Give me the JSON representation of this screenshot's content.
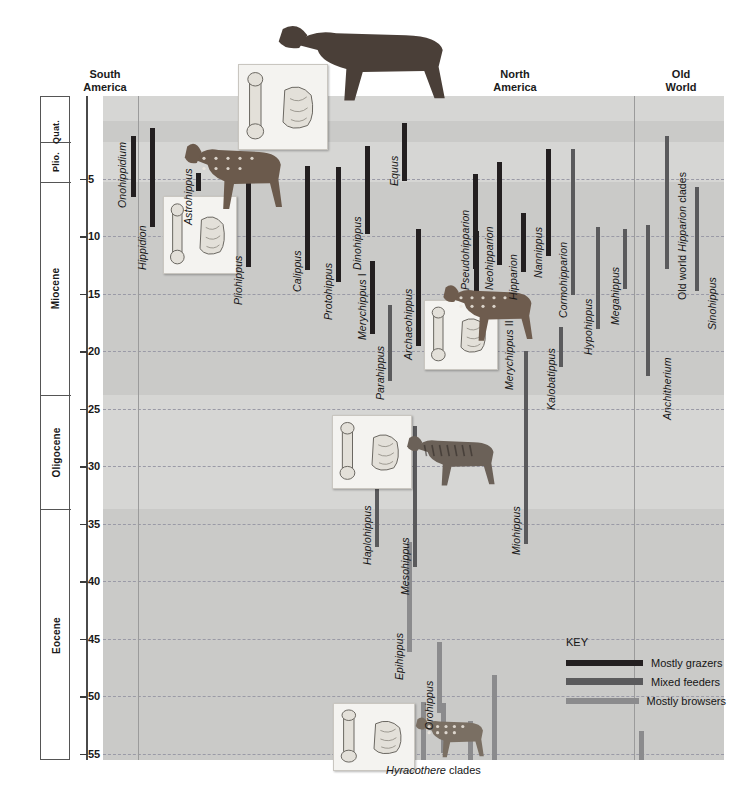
{
  "axis": {
    "title": "Million years ago",
    "ticks": [
      5,
      10,
      15,
      20,
      25,
      30,
      35,
      40,
      45,
      50,
      55
    ],
    "range_ma": [
      0,
      58
    ],
    "epochs": [
      {
        "name": "Quat.",
        "start_ma": 0,
        "end_ma": 1.8
      },
      {
        "name": "Plio.",
        "start_ma": 1.8,
        "end_ma": 5.3
      },
      {
        "name": "Miocene",
        "start_ma": 5.3,
        "end_ma": 23.8
      },
      {
        "name": "Oligocene",
        "start_ma": 23.8,
        "end_ma": 33.7
      },
      {
        "name": "Eocene",
        "start_ma": 33.7,
        "end_ma": 58
      }
    ]
  },
  "regions": [
    {
      "name": "South\nAmerica",
      "x_center": 105
    },
    {
      "name": "North\nAmerica",
      "x_center": 515
    },
    {
      "name": "Old\nWorld",
      "x_center": 681
    }
  ],
  "key": {
    "title": "KEY",
    "entries": [
      {
        "label": "Mostly grazers",
        "color": "#231f20"
      },
      {
        "label": "Mixed feeders",
        "color": "#5a5a5c"
      },
      {
        "label": "Mostly browsers",
        "color": "#8b8b8d"
      }
    ]
  },
  "footer_label": {
    "italic": "Hyracothere",
    "roman": " clades"
  },
  "chart_data": {
    "type": "bar",
    "ylabel": "Million years ago",
    "ylim": [
      0,
      58
    ],
    "grid": true,
    "legend": [
      "Mostly grazers",
      "Mixed feeders",
      "Mostly browsers"
    ],
    "categories": [
      "Onohippidium",
      "Hippidion",
      "Astrohippus",
      "Pliohippus",
      "Calippus",
      "Protohippus",
      "Dinohippus",
      "Equus",
      "Merychippus I",
      "Parahippus",
      "Archaeohippus",
      "Merychippus II",
      "Pseudohipparion",
      "Neohipparion",
      "Hipparion",
      "Nannippus",
      "Cormohipparion",
      "Kalobatippus",
      "Hypohippus",
      "Megahippus",
      "Old world Hipparion clades",
      "Sinohippus",
      "Anchitherium",
      "Haplohippus",
      "Mesohippus",
      "Miohippus",
      "Epihippus",
      "Orohippus",
      "Hyracothere clade A",
      "Hyracothere clade B",
      "Hyracothere clade C",
      "Hyracothere clade D",
      "Old World hyracothere"
    ],
    "series": [
      {
        "name": "stratigraphic ranges (Ma)",
        "bars": [
          {
            "taxon": "Onohippidium",
            "x": 131,
            "top_ma": 1.3,
            "bottom_ma": 6.6,
            "feeding": "Mostly grazers",
            "region": "South America"
          },
          {
            "taxon": "Hippidion",
            "x": 150,
            "top_ma": 0.6,
            "bottom_ma": 9.2,
            "feeding": "Mostly grazers",
            "region": "South America"
          },
          {
            "taxon": "Astrohippus",
            "x": 196,
            "top_ma": 4.5,
            "bottom_ma": 6.1,
            "feeding": "Mostly grazers",
            "region": "North America"
          },
          {
            "taxon": "Pliohippus",
            "x": 246,
            "top_ma": 4.0,
            "bottom_ma": 12.7,
            "feeding": "Mostly grazers",
            "region": "North America"
          },
          {
            "taxon": "Calippus",
            "x": 305,
            "top_ma": 3.9,
            "bottom_ma": 13.0,
            "feeding": "Mostly grazers",
            "region": "North America"
          },
          {
            "taxon": "Protohippus",
            "x": 336,
            "top_ma": 4.0,
            "bottom_ma": 14.0,
            "feeding": "Mostly grazers",
            "region": "North America"
          },
          {
            "taxon": "Dinohippus",
            "x": 365,
            "top_ma": 2.2,
            "bottom_ma": 9.8,
            "feeding": "Mostly grazers",
            "region": "North America"
          },
          {
            "taxon": "Equus",
            "x": 402,
            "top_ma": 0.2,
            "bottom_ma": 5.2,
            "feeding": "Mostly grazers",
            "region": "North America"
          },
          {
            "taxon": "Merychippus I",
            "x": 370,
            "top_ma": 12.2,
            "bottom_ma": 18.5,
            "feeding": "Mostly grazers",
            "region": "North America"
          },
          {
            "taxon": "Parahippus",
            "x": 388,
            "top_ma": 16.0,
            "bottom_ma": 22.6,
            "feeding": "Mixed feeders",
            "region": "North America"
          },
          {
            "taxon": "Archaeohippus",
            "x": 416,
            "top_ma": 9.4,
            "bottom_ma": 19.6,
            "feeding": "Mostly grazers",
            "region": "North America"
          },
          {
            "taxon": "Merychippus II",
            "x": 474,
            "top_ma": 9.6,
            "bottom_ma": 18.2,
            "feeding": "Mostly grazers",
            "region": "North America"
          },
          {
            "taxon": "Pseudohipparion",
            "x": 473,
            "top_ma": 4.6,
            "bottom_ma": 12.9,
            "feeding": "Mostly grazers",
            "region": "North America"
          },
          {
            "taxon": "Neohipparion",
            "x": 497,
            "top_ma": 3.6,
            "bottom_ma": 12.5,
            "feeding": "Mostly grazers",
            "region": "North America"
          },
          {
            "taxon": "Hipparion",
            "x": 521,
            "top_ma": 8.0,
            "bottom_ma": 13.1,
            "feeding": "Mostly grazers",
            "region": "North America"
          },
          {
            "taxon": "Nannippus",
            "x": 546,
            "top_ma": 2.4,
            "bottom_ma": 11.7,
            "feeding": "Mostly grazers",
            "region": "North America"
          },
          {
            "taxon": "Cormohipparion",
            "x": 571,
            "top_ma": 2.4,
            "bottom_ma": 15.1,
            "feeding": "Mixed feeders",
            "region": "North America"
          },
          {
            "taxon": "Kalobatippus",
            "x": 559,
            "top_ma": 17.9,
            "bottom_ma": 21.4,
            "feeding": "Mixed feeders",
            "region": "North America"
          },
          {
            "taxon": "Hypohippus",
            "x": 596,
            "top_ma": 9.2,
            "bottom_ma": 18.1,
            "feeding": "Mixed feeders",
            "region": "North America"
          },
          {
            "taxon": "Megahippus",
            "x": 623,
            "top_ma": 9.4,
            "bottom_ma": 14.6,
            "feeding": "Mixed feeders",
            "region": "North America"
          },
          {
            "taxon": "Old world Hipparion clades",
            "x": 665,
            "top_ma": 1.3,
            "bottom_ma": 12.9,
            "feeding": "Mixed feeders",
            "region": "Old World"
          },
          {
            "taxon": "Sinohippus",
            "x": 695,
            "top_ma": 5.7,
            "bottom_ma": 14.8,
            "feeding": "Mixed feeders",
            "region": "Old World"
          },
          {
            "taxon": "Anchitherium",
            "x": 646,
            "top_ma": 9.0,
            "bottom_ma": 22.2,
            "feeding": "Mixed feeders",
            "region": "Old World"
          },
          {
            "taxon": "Haplohippus",
            "x": 375,
            "top_ma": 32.0,
            "bottom_ma": 37.0,
            "feeding": "Mixed feeders",
            "region": "North America"
          },
          {
            "taxon": "Mesohippus",
            "x": 413,
            "top_ma": 26.5,
            "bottom_ma": 38.8,
            "feeding": "Mixed feeders",
            "region": "North America"
          },
          {
            "taxon": "Miohippus",
            "x": 524,
            "top_ma": 20.0,
            "bottom_ma": 36.8,
            "feeding": "Mixed feeders",
            "region": "North America"
          },
          {
            "taxon": "Epihippus",
            "x": 407,
            "top_ma": 36.6,
            "bottom_ma": 46.2,
            "feeding": "Mostly browsers",
            "region": "North America"
          },
          {
            "taxon": "Orohippus",
            "x": 437,
            "top_ma": 45.3,
            "bottom_ma": 51.5,
            "feeding": "Mostly browsers",
            "region": "North America"
          },
          {
            "taxon": "Hyracothere clade A",
            "x": 421,
            "top_ma": 50.5,
            "bottom_ma": 56.0,
            "feeding": "Mostly browsers",
            "region": "North America"
          },
          {
            "taxon": "Hyracothere clade B",
            "x": 441,
            "top_ma": 50.6,
            "bottom_ma": 55.0,
            "feeding": "Mostly browsers",
            "region": "North America"
          },
          {
            "taxon": "Hyracothere clade C",
            "x": 468,
            "top_ma": 52.2,
            "bottom_ma": 56.2,
            "feeding": "Mostly browsers",
            "region": "North America"
          },
          {
            "taxon": "Hyracothere clade D",
            "x": 492,
            "top_ma": 48.2,
            "bottom_ma": 57.0,
            "feeding": "Mostly browsers",
            "region": "North America"
          },
          {
            "taxon": "Old World hyracothere",
            "x": 639,
            "top_ma": 53.0,
            "bottom_ma": 56.0,
            "feeding": "Mostly browsers",
            "region": "Old World"
          }
        ]
      }
    ]
  }
}
